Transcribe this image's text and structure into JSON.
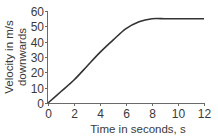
{
  "chart_data": {
    "type": "line",
    "title": "",
    "xlabel": "Time in seconds, s",
    "ylabel_lines": [
      "Velocity in m/s",
      "downwards"
    ],
    "ylabel": "Velocity in m/s downwards",
    "xlim": [
      0,
      12
    ],
    "ylim": [
      0,
      60
    ],
    "x_ticks": [
      0,
      2,
      4,
      6,
      8,
      10,
      12
    ],
    "y_ticks": [
      0,
      10,
      20,
      30,
      40,
      50,
      60
    ],
    "grid": false,
    "legend": null,
    "series": [
      {
        "name": "velocity",
        "color": "#333333",
        "x": [
          0,
          1,
          2,
          3,
          4,
          5,
          6,
          7,
          8,
          9,
          10,
          11,
          12
        ],
        "values": [
          0,
          7.5,
          15,
          24,
          33,
          41,
          48.5,
          53,
          55,
          55,
          55,
          55,
          55
        ]
      }
    ]
  }
}
